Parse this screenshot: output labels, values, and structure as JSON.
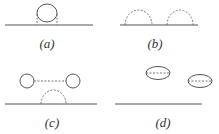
{
  "diagram": {
    "type": "feynman-diagrams",
    "panels": [
      {
        "id": "a",
        "label": "(a)",
        "description": "solid loop attached to horizontal line by two dashed propagators"
      },
      {
        "id": "b",
        "label": "(b)",
        "description": "two dashed semicircular arcs on horizontal line"
      },
      {
        "id": "c",
        "label": "(c)",
        "description": "two circles joined by dashed line above a dashed arc on horizontal line"
      },
      {
        "id": "d",
        "label": "(d)",
        "description": "two disconnected ellipses with internal dashed lines above horizontal line"
      }
    ]
  },
  "colors": {
    "line": "#555555",
    "dashed": "#777777",
    "label": "#333333"
  }
}
